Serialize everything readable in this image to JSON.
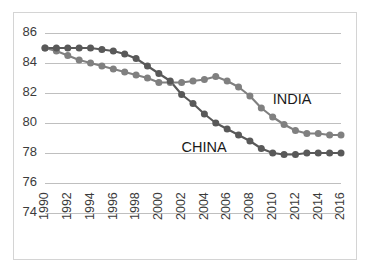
{
  "chart_data": {
    "type": "line",
    "title": "",
    "subtitle": "",
    "xlabel": "",
    "ylabel": "",
    "grid": true,
    "legend_position": "inline-annotation",
    "x": [
      1990,
      1991,
      1992,
      1993,
      1994,
      1995,
      1996,
      1997,
      1998,
      1999,
      2000,
      2001,
      2002,
      2003,
      2004,
      2005,
      2006,
      2007,
      2008,
      2009,
      2010,
      2011,
      2012,
      2013,
      2014,
      2015,
      2016
    ],
    "xlim": [
      1990,
      2016
    ],
    "ylim": [
      74,
      86
    ],
    "yticks": [
      74,
      76,
      78,
      80,
      82,
      84,
      86
    ],
    "xticks": [
      1990,
      1992,
      1994,
      1996,
      1998,
      2000,
      2002,
      2004,
      2006,
      2008,
      2010,
      2012,
      2014,
      2016
    ],
    "series": [
      {
        "name": "INDIA",
        "color": "#808080",
        "marker": "circle",
        "label_x": 2010,
        "label_y": 81.5,
        "values": [
          85.0,
          84.8,
          84.5,
          84.2,
          84.0,
          83.8,
          83.6,
          83.4,
          83.2,
          83.0,
          82.7,
          82.7,
          82.7,
          82.8,
          82.9,
          83.1,
          82.8,
          82.4,
          81.8,
          81.0,
          80.4,
          79.9,
          79.5,
          79.3,
          79.3,
          79.2,
          79.2
        ]
      },
      {
        "name": "CHINA",
        "color": "#595959",
        "marker": "circle",
        "label_x": 2002,
        "label_y": 78.3,
        "values": [
          85.0,
          85.0,
          85.0,
          85.0,
          85.0,
          84.9,
          84.8,
          84.6,
          84.3,
          83.8,
          83.3,
          82.8,
          81.9,
          81.3,
          80.6,
          80.0,
          79.6,
          79.2,
          78.8,
          78.3,
          78.0,
          77.9,
          77.9,
          78.0,
          78.0,
          78.0,
          78.0
        ]
      }
    ]
  },
  "ytick_labels": [
    "86",
    "84",
    "82",
    "80",
    "78",
    "76",
    "74"
  ],
  "xtick_labels": [
    "1990",
    "1992",
    "1994",
    "1996",
    "1998",
    "2000",
    "2002",
    "2004",
    "2006",
    "2008",
    "2010",
    "2012",
    "2014",
    "2016"
  ],
  "annotations": [
    {
      "text": "INDIA",
      "series": "INDIA"
    },
    {
      "text": "CHINA",
      "series": "CHINA"
    }
  ]
}
